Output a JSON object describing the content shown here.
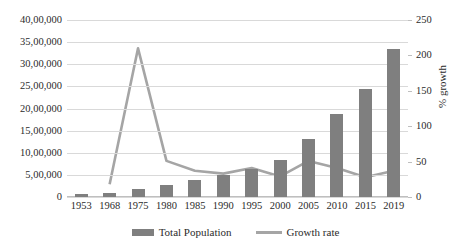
{
  "chart_data": {
    "type": "bar",
    "title": "",
    "xlabel": "",
    "ylabel": "",
    "ylabel_right": "% growth",
    "grid": true,
    "legend_position": "bottom",
    "categories": [
      "1953",
      "1968",
      "1975",
      "1980",
      "1985",
      "1990",
      "1995",
      "2000",
      "2005",
      "2010",
      "2015",
      "2019"
    ],
    "ylim": [
      0,
      4000000
    ],
    "yticks": [
      "0",
      "5,00,000",
      "10,00,000",
      "15,00,000",
      "20,00,000",
      "25,00,000",
      "30,00,000",
      "35,00,000",
      "40,00,000"
    ],
    "ytick_values": [
      0,
      500000,
      1000000,
      1500000,
      2000000,
      2500000,
      3000000,
      3500000,
      4000000
    ],
    "ylim_right": [
      0,
      250
    ],
    "yticks_right": [
      "0",
      "50",
      "100",
      "150",
      "200",
      "250"
    ],
    "ytick_values_right": [
      0,
      50,
      100,
      150,
      200,
      250
    ],
    "series": [
      {
        "name": "Total Population",
        "type": "bar",
        "axis": "left",
        "color": "#7f7f7f",
        "values": [
          60000,
          90000,
          180000,
          270000,
          380000,
          490000,
          630000,
          840000,
          1300000,
          1880000,
          2450000,
          3350000
        ]
      },
      {
        "name": "Growth rate",
        "type": "line",
        "axis": "right",
        "color": "#a5a5a5",
        "values": [
          null,
          18,
          210,
          51,
          37,
          33,
          41,
          29,
          51,
          41,
          28,
          37
        ]
      }
    ]
  },
  "legend": {
    "items": [
      {
        "label": "Total Population",
        "marker": "bar-swatch",
        "color": "#7f7f7f"
      },
      {
        "label": "Growth rate",
        "marker": "line-swatch",
        "color": "#a5a5a5"
      }
    ]
  },
  "axes": {
    "right_title": "% growth"
  }
}
